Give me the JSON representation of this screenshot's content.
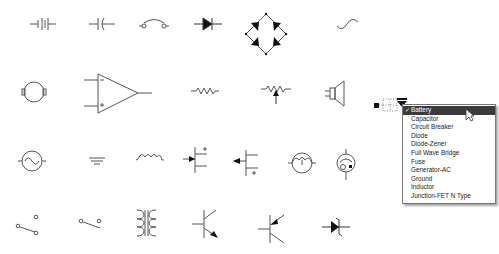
{
  "palette": {
    "symbols": [
      {
        "id": "battery",
        "row": 0,
        "col": 0
      },
      {
        "id": "capacitor",
        "row": 0,
        "col": 1
      },
      {
        "id": "circuit-breaker",
        "row": 0,
        "col": 2
      },
      {
        "id": "diode",
        "row": 0,
        "col": 3
      },
      {
        "id": "full-wave-bridge",
        "row": 0,
        "col": 4
      },
      {
        "id": "ac-source",
        "row": 0,
        "col": 5
      },
      {
        "id": "motor",
        "row": 1,
        "col": 0
      },
      {
        "id": "op-amp",
        "row": 1,
        "col": 1
      },
      {
        "id": "resistor",
        "row": 1,
        "col": 2
      },
      {
        "id": "potentiometer",
        "row": 1,
        "col": 3
      },
      {
        "id": "speaker",
        "row": 1,
        "col": 4
      },
      {
        "id": "generator-ac",
        "row": 2,
        "col": 0
      },
      {
        "id": "ground",
        "row": 2,
        "col": 1
      },
      {
        "id": "inductor",
        "row": 2,
        "col": 2
      },
      {
        "id": "jfet-n",
        "row": 2,
        "col": 3
      },
      {
        "id": "jfet-p",
        "row": 2,
        "col": 4
      },
      {
        "id": "lamp",
        "row": 2,
        "col": 5
      },
      {
        "id": "phototransistor",
        "row": 2,
        "col": 6
      },
      {
        "id": "switch-spdt",
        "row": 3,
        "col": 0
      },
      {
        "id": "switch-spst",
        "row": 3,
        "col": 1
      },
      {
        "id": "transformer",
        "row": 3,
        "col": 2
      },
      {
        "id": "transistor-npn",
        "row": 3,
        "col": 3
      },
      {
        "id": "transistor-pnp",
        "row": 3,
        "col": 4
      },
      {
        "id": "diode-zener",
        "row": 3,
        "col": 5
      }
    ]
  },
  "shape_menu": {
    "selected": "Battery",
    "items": [
      {
        "label": "Battery",
        "checked": "✓"
      },
      {
        "label": "Capacitor"
      },
      {
        "label": "Circuit Breaker"
      },
      {
        "label": "Diode"
      },
      {
        "label": "Diode-Zener"
      },
      {
        "label": "Full Wave Bridge"
      },
      {
        "label": "Fuse"
      },
      {
        "label": "Generator-AC"
      },
      {
        "label": "Ground"
      },
      {
        "label": "Inductor"
      },
      {
        "label": "Junction-FET N Type"
      }
    ]
  },
  "colors": {
    "stroke": "#555555",
    "menu_selected_bg": "#3b3b3b"
  }
}
